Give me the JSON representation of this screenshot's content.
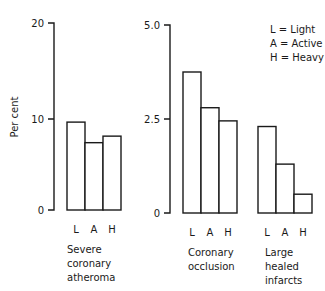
{
  "chart_data": [
    {
      "type": "bar",
      "title": "Severe coronary atheroma",
      "ylabel": "Per cent",
      "xlabel": "",
      "ylim": [
        0,
        20
      ],
      "yticks": [
        "0",
        "10",
        "20"
      ],
      "categories": [
        "L",
        "A",
        "H"
      ],
      "values": [
        9.4,
        7.2,
        7.9
      ],
      "group_label_lines": [
        "Severe",
        "coronary",
        "atheroma"
      ],
      "grid": false
    },
    {
      "type": "bar",
      "title": "Coronary occlusion",
      "ylabel": "",
      "xlabel": "",
      "ylim": [
        0,
        5.0
      ],
      "yticks": [
        "0",
        "2.5",
        "5.0"
      ],
      "categories": [
        "L",
        "A",
        "H"
      ],
      "values": [
        3.75,
        2.8,
        2.45
      ],
      "group_label_lines": [
        "Coronary",
        "occlusion"
      ],
      "grid": false
    },
    {
      "type": "bar",
      "title": "Large healed infarcts",
      "ylabel": "",
      "xlabel": "",
      "ylim": [
        0,
        5.0
      ],
      "yticks": [
        "0",
        "2.5",
        "5.0"
      ],
      "categories": [
        "L",
        "A",
        "H"
      ],
      "values": [
        2.3,
        1.3,
        0.5
      ],
      "group_label_lines": [
        "Large",
        "healed",
        "infarcts"
      ],
      "grid": false
    }
  ],
  "legend": {
    "position": "top-right",
    "entries": [
      "L = Light",
      "A = Active",
      "H = Heavy"
    ]
  },
  "axis_left": {
    "ylabel": "Per cent",
    "ticks": [
      "20",
      "10",
      "0"
    ]
  },
  "axis_right": {
    "ticks": [
      "5.0",
      "2.5",
      "0"
    ]
  }
}
